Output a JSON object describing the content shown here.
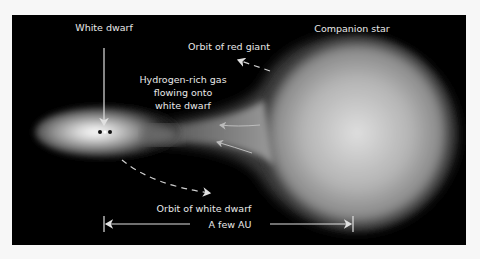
{
  "diagram": {
    "labels": {
      "white_dwarf": "White dwarf",
      "companion_star": "Companion star",
      "orbit_red_giant": "Orbit of red giant",
      "gas_flow_line1": "Hydrogen-rich gas",
      "gas_flow_line2": "flowing onto",
      "gas_flow_line3": "white dwarf",
      "orbit_white_dwarf": "Orbit of white dwarf",
      "scale": "A few AU"
    },
    "colors": {
      "background": "#000000",
      "label": "#e8e8e8",
      "star_core": "#dcdcdc",
      "star_edge": "#5a5a5a",
      "frame": "#f7f7f7"
    }
  }
}
